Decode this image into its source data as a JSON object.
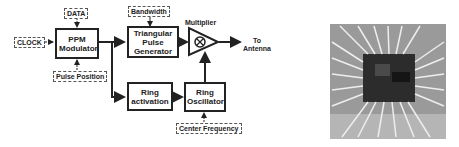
{
  "diagram": {
    "inputs": {
      "data": "DATA",
      "clock": "CLOCK",
      "pulse_position": "Pulse Position",
      "bandwidth": "Bandwidth",
      "center_frequency": "Center Frequency"
    },
    "blocks": {
      "ppm_modulator": "PPM Modulator",
      "triangular_pulse_generator": "Triangular Pulse Generator",
      "ring_activation": "Ring activation",
      "ring_oscillator": "Ring Oscillator",
      "multiplier": "Multiplier"
    },
    "output": "To Antenna",
    "multiplier_symbol": "⊗"
  },
  "photo": {
    "description": "chip-die-micrograph"
  }
}
